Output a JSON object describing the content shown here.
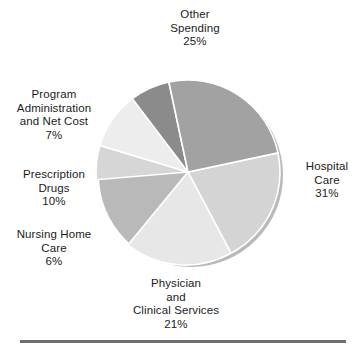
{
  "chart_data": {
    "type": "pie",
    "title": "",
    "subtitle": "",
    "xlabel": "",
    "ylabel": "",
    "legend_position": "none",
    "grid": false,
    "labels_outside": true,
    "units": "percent",
    "categories": [
      "Hospital Care",
      "Physician and Clinical Services",
      "Nursing Home Care",
      "Prescription Drugs",
      "Program Administration and Net Cost",
      "Other Spending"
    ],
    "values": [
      31,
      21,
      6,
      10,
      7,
      25
    ],
    "total": 100,
    "start_angle_deg": -12,
    "direction": "clockwise",
    "slices": [
      {
        "name": "Hospital Care",
        "value": 31,
        "value_label": "31%",
        "label_lines": [
          "Hospital",
          "Care",
          "31%"
        ],
        "color": "#d4d4d4"
      },
      {
        "name": "Physician and Clinical Services",
        "value": 21,
        "value_label": "21%",
        "label_lines": [
          "Physician",
          "and",
          "Clinical Services",
          "21%"
        ],
        "color": "#e7e7e7"
      },
      {
        "name": "Nursing Home Care",
        "value": 6,
        "value_label": "6%",
        "label_lines": [
          "Nursing Home",
          "Care",
          "6%"
        ],
        "color": "#d6d6d6"
      },
      {
        "name": "Prescription Drugs",
        "value": 10,
        "value_label": "10%",
        "label_lines": [
          "Prescription",
          "Drugs",
          "10%"
        ],
        "color": "#ededed"
      },
      {
        "name": "Program Administration and Net Cost",
        "value": 7,
        "value_label": "7%",
        "label_lines": [
          "Program",
          "Administration",
          "and Net Cost",
          "7%"
        ],
        "color": "#8b8b8b"
      },
      {
        "name": "Other Spending",
        "value": 25,
        "value_label": "25%",
        "label_lines": [
          "Other",
          "Spending",
          "25%"
        ],
        "color": "#a2a2a2"
      }
    ]
  },
  "labels": {
    "other_spending": "Other\nSpending\n25%",
    "program_administration": "Program\nAdministration\nand Net Cost\n7%",
    "prescription_drugs": "Prescription\nDrugs\n10%",
    "nursing_home_care": "Nursing Home\nCare\n6%",
    "hospital_care": "Hospital\nCare\n31%",
    "physician_clinical": "Physician\nand\nClinical Services\n21%"
  },
  "colors": {
    "background": "#ffffff",
    "text": "#1c1c1c",
    "rule": "#6e6e6e",
    "slice_edge": "#ffffff",
    "pie_shadow": "#b8b8b8"
  }
}
